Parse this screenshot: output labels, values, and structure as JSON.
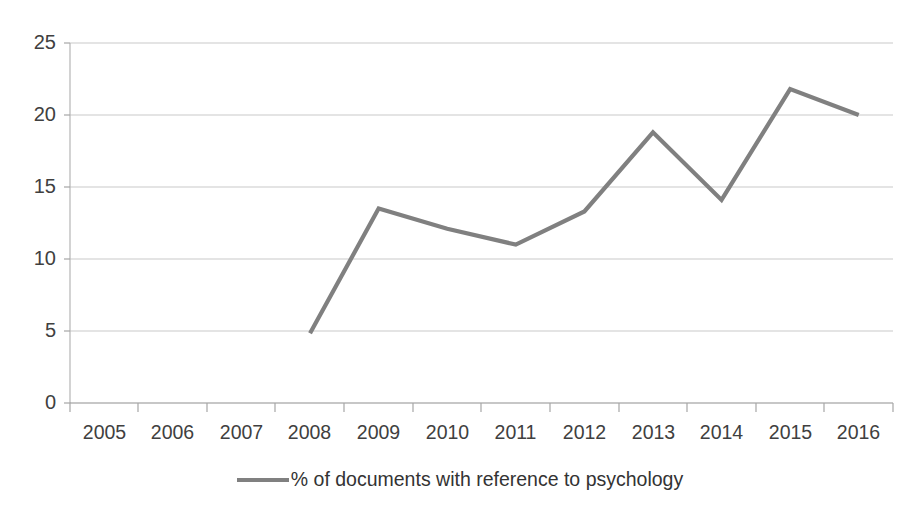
{
  "chart_data": {
    "type": "line",
    "title": "",
    "xlabel": "",
    "ylabel": "",
    "categories": [
      "2005",
      "2006",
      "2007",
      "2008",
      "2009",
      "2010",
      "2011",
      "2012",
      "2013",
      "2014",
      "2015",
      "2016"
    ],
    "series": [
      {
        "name": "% of documents with reference to psychology",
        "color": "#808080",
        "values": [
          null,
          null,
          null,
          4.85,
          13.5,
          12.1,
          11.0,
          13.3,
          18.8,
          14.1,
          21.8,
          20.0
        ]
      }
    ],
    "ylim": [
      0,
      25
    ],
    "ytick_labels": [
      "0",
      "5",
      "10",
      "15",
      "20",
      "25"
    ],
    "ytick_values": [
      0,
      5,
      10,
      15,
      20,
      25
    ],
    "grid": true,
    "grid_axis": "y",
    "legend_position": "bottom",
    "legend_entries": [
      "% of documents with reference to psychology"
    ]
  },
  "axes": {
    "y_labels": [
      "25",
      "20",
      "15",
      "10",
      "5",
      "0"
    ],
    "x_labels": [
      "2005",
      "2006",
      "2007",
      "2008",
      "2009",
      "2010",
      "2011",
      "2012",
      "2013",
      "2014",
      "2015",
      "2016"
    ]
  },
  "legend": {
    "label": "% of documents with reference to psychology"
  },
  "colors": {
    "line": "#808080",
    "grid": "#c9c9c9",
    "axis": "#a6a6a6",
    "text": "#404040"
  }
}
